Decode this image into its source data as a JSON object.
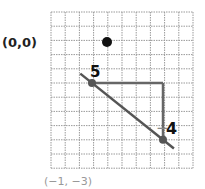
{
  "diagram": {
    "grid": {
      "columns": 10,
      "rows": 11,
      "line_color": "#9a9a9a"
    },
    "origin_label": "(0,0)",
    "origin_point": {
      "col": 4,
      "row": 2
    },
    "start_point": {
      "col": 3,
      "row": 5,
      "color": "#555555"
    },
    "end_point": {
      "col": 8,
      "row": 9,
      "color": "#555555"
    },
    "rise_run": {
      "run_label": "5",
      "rise_label_sign": "−",
      "rise_label_value": "4",
      "color": "#666666"
    },
    "line": {
      "color": "#555555"
    },
    "bottom_label": "(−1, −3)",
    "colors": {
      "ink": "#111111",
      "muted": "#888888"
    }
  }
}
